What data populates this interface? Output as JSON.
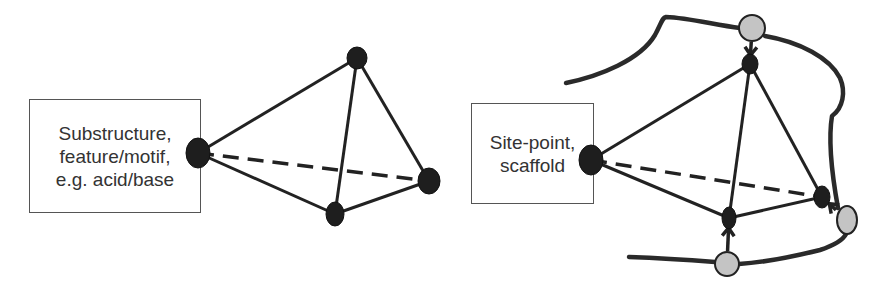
{
  "colors": {
    "node_dark": "#1e1e1e",
    "node_gray": "#c4c4c4",
    "edge": "#222222",
    "box_border": "#555555",
    "text": "#333333",
    "background": "#ffffff"
  },
  "left_diagram": {
    "box": {
      "lines": [
        "Substructure,",
        "feature/motif,",
        "e.g. acid/base"
      ]
    },
    "nodes": [
      {
        "id": "L0",
        "x": 198,
        "y": 153,
        "rx": 12,
        "ry": 15
      },
      {
        "id": "L1",
        "x": 357,
        "y": 58,
        "rx": 10,
        "ry": 11
      },
      {
        "id": "L2",
        "x": 335,
        "y": 214,
        "rx": 9,
        "ry": 12
      },
      {
        "id": "L3",
        "x": 429,
        "y": 181,
        "rx": 11,
        "ry": 13
      }
    ],
    "edges": [
      {
        "from": "L0",
        "to": "L1",
        "style": "solid"
      },
      {
        "from": "L0",
        "to": "L2",
        "style": "solid"
      },
      {
        "from": "L0",
        "to": "L3",
        "style": "dashed"
      },
      {
        "from": "L1",
        "to": "L2",
        "style": "solid"
      },
      {
        "from": "L1",
        "to": "L3",
        "style": "solid"
      },
      {
        "from": "L2",
        "to": "L3",
        "style": "solid"
      }
    ]
  },
  "right_diagram": {
    "box": {
      "lines": [
        "Site-point,",
        "scaffold"
      ]
    },
    "nodes": [
      {
        "id": "R0",
        "x": 591,
        "y": 160,
        "rx": 12,
        "ry": 15
      },
      {
        "id": "R1",
        "x": 750,
        "y": 64,
        "rx": 8,
        "ry": 10
      },
      {
        "id": "R2",
        "x": 729,
        "y": 218,
        "rx": 7,
        "ry": 11
      },
      {
        "id": "R3",
        "x": 822,
        "y": 197,
        "rx": 8,
        "ry": 11
      }
    ],
    "receptor_sites": [
      {
        "id": "G1",
        "x": 752,
        "y": 28,
        "rx": 13,
        "ry": 13
      },
      {
        "id": "G2",
        "x": 847,
        "y": 220,
        "rx": 10,
        "ry": 14
      },
      {
        "id": "G3",
        "x": 727,
        "y": 264,
        "rx": 12,
        "ry": 12
      }
    ],
    "edges": [
      {
        "from": "R0",
        "to": "R1",
        "style": "solid"
      },
      {
        "from": "R0",
        "to": "R2",
        "style": "solid"
      },
      {
        "from": "R0",
        "to": "R3",
        "style": "dashed"
      },
      {
        "from": "R1",
        "to": "R2",
        "style": "solid"
      },
      {
        "from": "R1",
        "to": "R3",
        "style": "solid"
      },
      {
        "from": "R2",
        "to": "R3",
        "style": "solid"
      }
    ],
    "interactions": [
      {
        "from": "G1",
        "to": "R1"
      },
      {
        "from": "G2",
        "to": "R3"
      },
      {
        "from": "G3",
        "to": "R2"
      }
    ]
  }
}
